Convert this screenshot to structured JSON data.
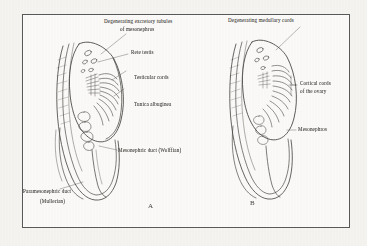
{
  "figure": {
    "kind": "anatomical-line-drawing",
    "background_color": "#f6f5f2",
    "plate_background": "#fcfbf9",
    "ink_color": "#3a3936",
    "border_color": "#5a5a58"
  },
  "panels": [
    {
      "letter": "A",
      "subject": "Developing testis",
      "labels": [
        {
          "name": "degenerating-excretory-tubules",
          "line1": "Degenerating excretory tubules",
          "line2": "of mesonephros"
        },
        {
          "name": "rete-testis",
          "line1": "Rete testis"
        },
        {
          "name": "testicular-cords",
          "line1": "Testicular cords"
        },
        {
          "name": "tunica-albuginea",
          "line1": "Tunica albuginea"
        },
        {
          "name": "mesonephric-duct",
          "line1": "Mesonephric duct (Wolffian)"
        },
        {
          "name": "paramesonephric-duct",
          "line1": "Paramesonephric duct",
          "line2": "(Mullerian)"
        }
      ]
    },
    {
      "letter": "B",
      "subject": "Developing ovary",
      "labels": [
        {
          "name": "degenerating-medullary-cords",
          "line1": "Degenerating medullary cords"
        },
        {
          "name": "cortical-cords-of-ovary",
          "line1": "Cortical cords",
          "line2": "of the ovary"
        },
        {
          "name": "mesonephros",
          "line1": "Mesonephros"
        }
      ]
    }
  ]
}
